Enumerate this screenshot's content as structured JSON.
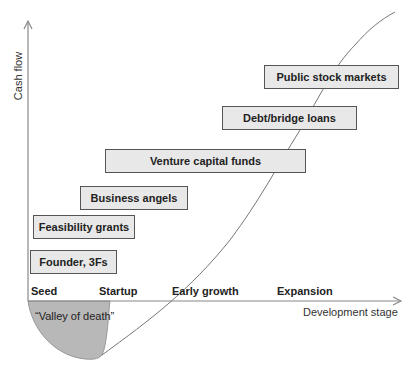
{
  "axes": {
    "y_label": "Cash flow",
    "x_label": "Development stage"
  },
  "stages": [
    "Seed",
    "Startup",
    "Early growth",
    "Expansion"
  ],
  "funding_sources": [
    {
      "label": "Founder, 3Fs"
    },
    {
      "label": "Feasibility grants"
    },
    {
      "label": "Business angels"
    },
    {
      "label": "Venture capital funds"
    },
    {
      "label": "Debt/bridge loans"
    },
    {
      "label": "Public stock markets"
    }
  ],
  "annotations": {
    "valley": "“Valley of death”"
  },
  "colors": {
    "box_fill": "#e8e8e8",
    "box_border": "#555555",
    "valley_fill": "#b8b8b8",
    "line": "#777777"
  }
}
